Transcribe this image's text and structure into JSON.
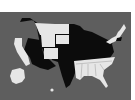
{
  "map": {
    "title": "",
    "background_color": "#5e5e5e",
    "colors": {
      "group_a": "#0c0c0c",
      "group_b": "#e6e6e6"
    },
    "states_white": [
      "WA-no",
      "CA",
      "MT",
      "ND",
      "WY",
      "SD",
      "CO",
      "TN",
      "NC",
      "SC",
      "GA",
      "AL",
      "MS",
      "FL",
      "NY",
      "VT",
      "NH",
      "ME",
      "AK"
    ],
    "states_black": [
      "WA",
      "OR",
      "ID",
      "NV",
      "UT",
      "AZ",
      "NM",
      "TX",
      "OK",
      "KS",
      "NE",
      "MN",
      "IA",
      "MO",
      "AR",
      "LA",
      "WI",
      "IL",
      "MI",
      "IN",
      "OH",
      "KY",
      "WV",
      "VA",
      "PA",
      "MA",
      "CT"
    ],
    "legend": []
  }
}
